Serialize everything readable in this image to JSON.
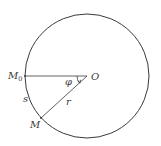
{
  "diagram": {
    "type": "circle-arc-geometry",
    "colors": {
      "stroke": "#3a3a3a",
      "background": "#ffffff"
    },
    "circle": {
      "cx": 87,
      "cy": 76,
      "r": 62
    },
    "points": {
      "center": {
        "label": "O",
        "x": 87,
        "y": 76
      },
      "start": {
        "label": "M",
        "subscript": "0",
        "x": 25,
        "y": 76
      },
      "moving": {
        "label": "M",
        "x": 41,
        "y": 118
      }
    },
    "segments": [
      {
        "name": "radius-horizontal",
        "from": "start",
        "to": "center"
      },
      {
        "name": "radius-r",
        "from": "center",
        "to": "moving",
        "label": "r"
      }
    ],
    "angle": {
      "label": "φ",
      "vertex": "center",
      "from": "start",
      "to": "moving"
    },
    "arc": {
      "label": "s",
      "from": "start",
      "to": "moving"
    },
    "labels": {
      "O": "O",
      "M0_main": "M",
      "M0_sub": "0",
      "M": "M",
      "phi": "φ",
      "s": "s",
      "r": "r"
    }
  }
}
